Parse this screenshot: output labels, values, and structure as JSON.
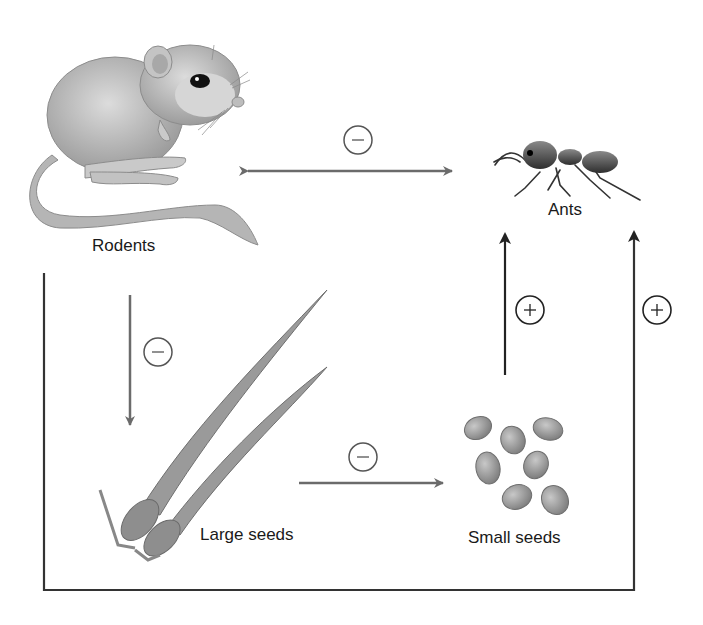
{
  "diagram": {
    "type": "food-web interaction diagram",
    "nodes": {
      "rodents": {
        "label": "Rodents",
        "icon": "rodent-illustration"
      },
      "ants": {
        "label": "Ants",
        "icon": "ant-illustration"
      },
      "large_seeds": {
        "label": "Large seeds",
        "icon": "large-seeds-illustration"
      },
      "small_seeds": {
        "label": "Small seeds",
        "icon": "small-seeds-illustration"
      }
    },
    "edges": [
      {
        "from": "rodents",
        "to": "ants",
        "sign": "−",
        "bidirectional": true
      },
      {
        "from": "rodents",
        "to": "large_seeds",
        "sign": "−"
      },
      {
        "from": "large_seeds",
        "to": "small_seeds",
        "sign": "−"
      },
      {
        "from": "small_seeds",
        "to": "ants",
        "sign": "+"
      },
      {
        "from": "rodents",
        "to": "ants",
        "sign": "+",
        "route": "indirect loop around bottom"
      }
    ],
    "colors": {
      "arrow_gray": "#6b6b6b",
      "arrow_dark": "#2a2a2a",
      "line": "#3a3a3a",
      "illustration_gray": "#a9a9a9"
    }
  }
}
